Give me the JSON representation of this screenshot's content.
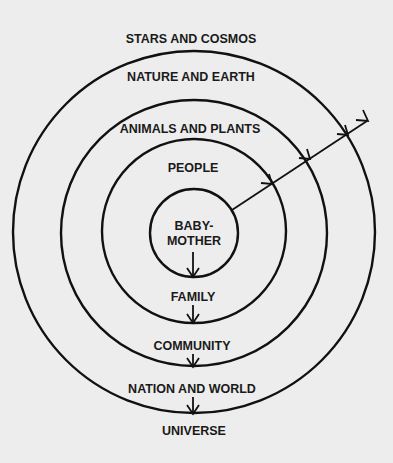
{
  "diagram": {
    "type": "concentric-circles",
    "rings_inner_to_outer": [
      {
        "inside_label": "BABY-\nMOTHER",
        "below_label": "FAMILY"
      },
      {
        "inside_label": "PEOPLE",
        "below_label": "COMMUNITY"
      },
      {
        "inside_label": "ANIMALS AND PLANTS",
        "below_label": "NATION AND WORLD"
      },
      {
        "inside_label": "NATURE AND EARTH",
        "below_label": "UNIVERSE"
      }
    ],
    "labels": {
      "outside_top": "STARS AND COSMOS",
      "ring4_top": "NATURE AND EARTH",
      "ring3_top": "ANIMALS AND PLANTS",
      "ring2_top": "PEOPLE",
      "center_line1": "BABY-",
      "center_line2": "MOTHER",
      "below_ring1": "FAMILY",
      "below_ring2": "COMMUNITY",
      "below_ring3": "NATION AND WORLD",
      "below_ring4": "UNIVERSE"
    },
    "arrows": {
      "radial": "outward diagonal arrow from center circle crossing every ring",
      "vertical": "downward arrows from each ring to the label below"
    },
    "colors": {
      "line": "#111111",
      "background": "#ededed",
      "text": "#1a1a1a"
    }
  }
}
